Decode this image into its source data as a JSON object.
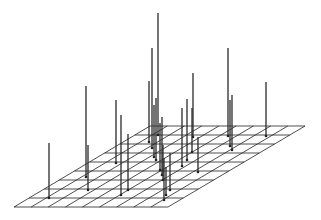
{
  "chart_data": {
    "type": "stem3d",
    "title": "",
    "xlabel": "",
    "ylabel": "",
    "zlabel": "",
    "grid": {
      "plane": "parallelogram",
      "columns": 9,
      "rows": 9,
      "corners_px": {
        "bottom_left": [
          14,
          207
        ],
        "bottom_right": [
          168,
          207
        ],
        "top_left": [
          150,
          126
        ],
        "top_right": [
          305,
          126
        ]
      }
    },
    "line_color": "#222222",
    "background": "#ffffff",
    "stems": [
      {
        "base": [
          49,
          198
        ],
        "height": 55
      },
      {
        "base": [
          86,
          177
        ],
        "height": 91
      },
      {
        "base": [
          88,
          190
        ],
        "height": 45
      },
      {
        "base": [
          116,
          163
        ],
        "height": 63
      },
      {
        "base": [
          121,
          195
        ],
        "height": 80
      },
      {
        "base": [
          128,
          190
        ],
        "height": 56
      },
      {
        "base": [
          149,
          142
        ],
        "height": 61
      },
      {
        "base": [
          152,
          148
        ],
        "height": 100
      },
      {
        "base": [
          154,
          157
        ],
        "height": 52
      },
      {
        "base": [
          156,
          160
        ],
        "height": 62
      },
      {
        "base": [
          158,
          135
        ],
        "height": 122
      },
      {
        "base": [
          160,
          170
        ],
        "height": 47
      },
      {
        "base": [
          162,
          175
        ],
        "height": 58
      },
      {
        "base": [
          163,
          180
        ],
        "height": 35
      },
      {
        "base": [
          164,
          200
        ],
        "height": 42
      },
      {
        "base": [
          166,
          195
        ],
        "height": 28
      },
      {
        "base": [
          170,
          190
        ],
        "height": 37
      },
      {
        "base": [
          182,
          166
        ],
        "height": 58
      },
      {
        "base": [
          187,
          160
        ],
        "height": 61
      },
      {
        "base": [
          192,
          152
        ],
        "height": 44
      },
      {
        "base": [
          193,
          137
        ],
        "height": 64
      },
      {
        "base": [
          198,
          172
        ],
        "height": 35
      },
      {
        "base": [
          228,
          136
        ],
        "height": 88
      },
      {
        "base": [
          230,
          146
        ],
        "height": 46
      },
      {
        "base": [
          232,
          150
        ],
        "height": 55
      },
      {
        "base": [
          266,
          136
        ],
        "height": 54
      }
    ]
  }
}
